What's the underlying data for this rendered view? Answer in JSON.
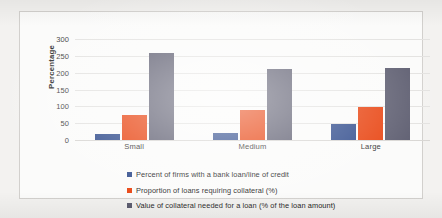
{
  "chart_data": {
    "type": "bar",
    "title": "",
    "subtitle": "",
    "xlabel": "",
    "ylabel": "Percentage",
    "ylim": [
      0,
      300
    ],
    "yticks": [
      0,
      50,
      100,
      150,
      200,
      250,
      300
    ],
    "grid": true,
    "legend_position": "bottom-left",
    "categories": [
      "Small",
      "Medium",
      "Large"
    ],
    "series": [
      {
        "name": "Percent of firms with a bank loan/line of credit",
        "color": "#2e4a8b",
        "values": [
          18,
          22,
          48
        ]
      },
      {
        "name": "Proportion of loans requiring collateral (%)",
        "color": "#e8400c",
        "values": [
          73,
          90,
          97
        ]
      },
      {
        "name": "Value of collateral needed for a loan (% of the loan amount)",
        "color": "#5b5b6e",
        "values": [
          258,
          212,
          213
        ]
      }
    ]
  },
  "axis": {
    "y_label": "Percentage",
    "tick_0": "0",
    "tick_50": "50",
    "tick_100": "100",
    "tick_150": "150",
    "tick_200": "200",
    "tick_250": "250",
    "tick_300": "300"
  },
  "categories": {
    "small": "Small",
    "medium": "Medium",
    "large": "Large"
  },
  "legend": {
    "item_1": "Percent of firms with a bank loan/line of credit",
    "item_2": "Proportion of loans requiring collateral (%)",
    "item_3": "Value of collateral needed for a loan (% of the loan amount)"
  }
}
